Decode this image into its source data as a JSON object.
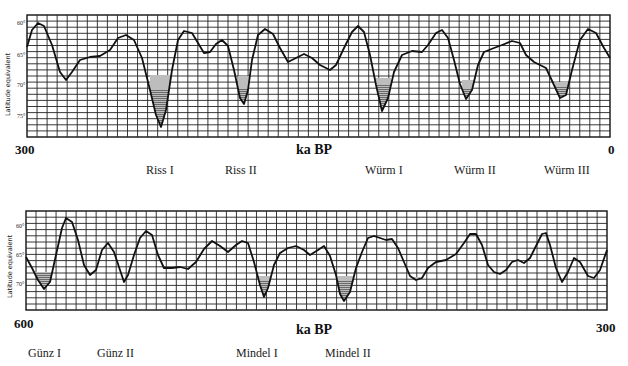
{
  "chart_data": [
    {
      "type": "line",
      "title": "",
      "xlabel": "ka BP",
      "ylabel": "Latitude equivalent",
      "x_start_label": "300",
      "x_end_label": "0",
      "xlim": [
        300,
        0
      ],
      "y_ticks": [
        "60°",
        "65°",
        "70°",
        "75°"
      ],
      "ylim": [
        58,
        78
      ],
      "inverted_y": true,
      "grid": true,
      "glacial_labels": [
        "Riss I",
        "Riss II",
        "Würm I",
        "Würm II",
        "Würm III"
      ],
      "frame_px": {
        "x0": 27,
        "y0": 15,
        "x1": 610,
        "y1": 137
      },
      "tick_px": [
        26,
        57,
        87,
        118
      ],
      "curve_px": [
        [
          27,
          47
        ],
        [
          32,
          30
        ],
        [
          38,
          23
        ],
        [
          44,
          26
        ],
        [
          52,
          45
        ],
        [
          60,
          72
        ],
        [
          66,
          80
        ],
        [
          72,
          72
        ],
        [
          80,
          60
        ],
        [
          90,
          57
        ],
        [
          100,
          56
        ],
        [
          110,
          50
        ],
        [
          118,
          38
        ],
        [
          126,
          35
        ],
        [
          134,
          40
        ],
        [
          142,
          58
        ],
        [
          150,
          90
        ],
        [
          156,
          115
        ],
        [
          161,
          127
        ],
        [
          166,
          110
        ],
        [
          172,
          70
        ],
        [
          178,
          40
        ],
        [
          184,
          31
        ],
        [
          192,
          33
        ],
        [
          198,
          43
        ],
        [
          204,
          53
        ],
        [
          210,
          52
        ],
        [
          216,
          44
        ],
        [
          222,
          40
        ],
        [
          228,
          46
        ],
        [
          234,
          70
        ],
        [
          240,
          98
        ],
        [
          244,
          104
        ],
        [
          248,
          90
        ],
        [
          252,
          60
        ],
        [
          258,
          35
        ],
        [
          265,
          29
        ],
        [
          273,
          34
        ],
        [
          280,
          48
        ],
        [
          288,
          62
        ],
        [
          296,
          58
        ],
        [
          304,
          54
        ],
        [
          312,
          58
        ],
        [
          320,
          65
        ],
        [
          330,
          70
        ],
        [
          336,
          65
        ],
        [
          344,
          48
        ],
        [
          352,
          32
        ],
        [
          358,
          26
        ],
        [
          364,
          32
        ],
        [
          370,
          55
        ],
        [
          376,
          85
        ],
        [
          382,
          111
        ],
        [
          388,
          98
        ],
        [
          394,
          72
        ],
        [
          402,
          55
        ],
        [
          412,
          51
        ],
        [
          422,
          52
        ],
        [
          428,
          45
        ],
        [
          436,
          33
        ],
        [
          442,
          30
        ],
        [
          448,
          38
        ],
        [
          454,
          60
        ],
        [
          460,
          84
        ],
        [
          466,
          99
        ],
        [
          472,
          90
        ],
        [
          478,
          65
        ],
        [
          484,
          52
        ],
        [
          494,
          48
        ],
        [
          502,
          45
        ],
        [
          512,
          41
        ],
        [
          520,
          43
        ],
        [
          526,
          55
        ],
        [
          534,
          62
        ],
        [
          546,
          68
        ],
        [
          554,
          85
        ],
        [
          560,
          98
        ],
        [
          566,
          95
        ],
        [
          572,
          70
        ],
        [
          580,
          40
        ],
        [
          588,
          29
        ],
        [
          596,
          33
        ],
        [
          604,
          48
        ],
        [
          610,
          58
        ]
      ],
      "shaded_troughs_px": [
        {
          "name": "Riss I",
          "x0": 150,
          "x1": 170,
          "y_top": 75
        },
        {
          "name": "Riss II",
          "x0": 238,
          "x1": 250,
          "y_top": 76
        },
        {
          "name": "Würm I",
          "x0": 374,
          "x1": 391,
          "y_top": 78
        },
        {
          "name": "Würm II",
          "x0": 462,
          "x1": 474,
          "y_top": 80
        },
        {
          "name": "Würm III",
          "x0": 555,
          "x1": 568,
          "y_top": 82
        }
      ],
      "approx_minima_ka_BP": [
        {
          "label": "Riss I",
          "ka": 231,
          "lat": 75.5
        },
        {
          "label": "Riss II",
          "ka": 187,
          "lat": 71.6
        },
        {
          "label": "Würm I",
          "ka": 117,
          "lat": 73.0
        },
        {
          "label": "Würm II",
          "ka": 73,
          "lat": 70.8
        },
        {
          "label": "Würm III",
          "ka": 24,
          "lat": 70.3
        }
      ]
    },
    {
      "type": "line",
      "title": "",
      "xlabel": "ka BP",
      "ylabel": "Latitude equivalent",
      "x_start_label": "600",
      "x_end_label": "300",
      "xlim": [
        600,
        300
      ],
      "y_ticks": [
        "60°",
        "65°",
        "70°"
      ],
      "ylim": [
        57,
        74
      ],
      "inverted_y": true,
      "grid": true,
      "glacial_labels": [
        "Günz I",
        "Günz II",
        "Mindel I",
        "Mindel II"
      ],
      "frame_px": {
        "x0": 26,
        "y0": 211,
        "x1": 607,
        "y1": 310
      },
      "tick_px": [
        228,
        257,
        286
      ],
      "curve_px": [
        [
          26,
          257
        ],
        [
          32,
          268
        ],
        [
          38,
          280
        ],
        [
          44,
          289
        ],
        [
          50,
          282
        ],
        [
          56,
          255
        ],
        [
          62,
          228
        ],
        [
          66,
          218
        ],
        [
          72,
          222
        ],
        [
          78,
          240
        ],
        [
          84,
          265
        ],
        [
          90,
          275
        ],
        [
          96,
          270
        ],
        [
          102,
          250
        ],
        [
          108,
          243
        ],
        [
          114,
          252
        ],
        [
          120,
          270
        ],
        [
          124,
          282
        ],
        [
          128,
          275
        ],
        [
          134,
          255
        ],
        [
          140,
          238
        ],
        [
          146,
          231
        ],
        [
          152,
          235
        ],
        [
          158,
          255
        ],
        [
          164,
          268
        ],
        [
          172,
          268
        ],
        [
          180,
          267
        ],
        [
          188,
          269
        ],
        [
          196,
          262
        ],
        [
          204,
          249
        ],
        [
          212,
          241
        ],
        [
          220,
          246
        ],
        [
          228,
          252
        ],
        [
          236,
          245
        ],
        [
          242,
          241
        ],
        [
          248,
          243
        ],
        [
          254,
          262
        ],
        [
          260,
          285
        ],
        [
          264,
          297
        ],
        [
          268,
          288
        ],
        [
          274,
          265
        ],
        [
          280,
          253
        ],
        [
          288,
          248
        ],
        [
          296,
          246
        ],
        [
          304,
          250
        ],
        [
          310,
          255
        ],
        [
          318,
          250
        ],
        [
          324,
          246
        ],
        [
          330,
          256
        ],
        [
          336,
          275
        ],
        [
          340,
          294
        ],
        [
          344,
          301
        ],
        [
          350,
          292
        ],
        [
          356,
          268
        ],
        [
          362,
          252
        ],
        [
          368,
          238
        ],
        [
          374,
          236
        ],
        [
          380,
          238
        ],
        [
          386,
          240
        ],
        [
          392,
          239
        ],
        [
          398,
          248
        ],
        [
          404,
          262
        ],
        [
          410,
          276
        ],
        [
          416,
          280
        ],
        [
          422,
          278
        ],
        [
          428,
          268
        ],
        [
          436,
          262
        ],
        [
          446,
          260
        ],
        [
          456,
          254
        ],
        [
          464,
          243
        ],
        [
          470,
          234
        ],
        [
          476,
          234
        ],
        [
          482,
          245
        ],
        [
          488,
          265
        ],
        [
          494,
          272
        ],
        [
          500,
          274
        ],
        [
          506,
          270
        ],
        [
          512,
          262
        ],
        [
          518,
          260
        ],
        [
          524,
          263
        ],
        [
          530,
          258
        ],
        [
          536,
          246
        ],
        [
          542,
          234
        ],
        [
          546,
          233
        ],
        [
          550,
          245
        ],
        [
          556,
          268
        ],
        [
          562,
          282
        ],
        [
          568,
          272
        ],
        [
          574,
          258
        ],
        [
          580,
          262
        ],
        [
          588,
          276
        ],
        [
          594,
          278
        ],
        [
          600,
          270
        ],
        [
          607,
          250
        ]
      ],
      "shaded_troughs_px": [
        {
          "name": "Günz I",
          "x0": 34,
          "x1": 52,
          "y_top": 272
        },
        {
          "name": "Mindel I",
          "x0": 257,
          "x1": 270,
          "y_top": 276
        },
        {
          "name": "Mindel II",
          "x0": 336,
          "x1": 353,
          "y_top": 276
        },
        {
          "name": "minor",
          "x0": 410,
          "x1": 420,
          "y_top": 277
        }
      ],
      "approx_minima_ka_BP": [
        {
          "label": "Günz I",
          "ka": 590,
          "lat": 71.1
        },
        {
          "label": "Günz II",
          "ka": 550,
          "lat": 69.3
        },
        {
          "label": "Mindel I",
          "ka": 477,
          "lat": 71.9
        },
        {
          "label": "Mindel II",
          "ka": 436,
          "lat": 72.6
        }
      ]
    }
  ],
  "top": {
    "ylabel": "Latitude equivalent",
    "ticks": [
      "60°",
      "65°",
      "70°",
      "75°"
    ],
    "start": "300",
    "unit": "ka BP",
    "end": "0",
    "labels": [
      "Riss I",
      "Riss II",
      "Würm I",
      "Würm II",
      "Würm III"
    ]
  },
  "bottom": {
    "ylabel": "Latitude equivalent",
    "ticks": [
      "60°",
      "65°",
      "70°"
    ],
    "start": "600",
    "unit": "ka BP",
    "end": "300",
    "labels": [
      "Günz I",
      "Günz II",
      "Mindel I",
      "Mindel II"
    ]
  }
}
